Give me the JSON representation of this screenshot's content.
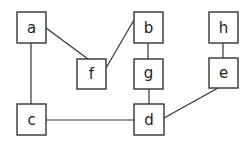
{
  "diagram": {
    "type": "undirected-graph",
    "nodes": [
      {
        "id": "a",
        "label": "a",
        "x": 17,
        "y": 12,
        "w": 29,
        "h": 31
      },
      {
        "id": "f",
        "label": "f",
        "x": 77,
        "y": 59,
        "w": 29,
        "h": 30
      },
      {
        "id": "b",
        "label": "b",
        "x": 134,
        "y": 12,
        "w": 29,
        "h": 31
      },
      {
        "id": "g",
        "label": "g",
        "x": 134,
        "y": 59,
        "w": 29,
        "h": 30
      },
      {
        "id": "h",
        "label": "h",
        "x": 209,
        "y": 12,
        "w": 29,
        "h": 31
      },
      {
        "id": "e",
        "label": "e",
        "x": 209,
        "y": 58,
        "w": 29,
        "h": 30
      },
      {
        "id": "c",
        "label": "c",
        "x": 17,
        "y": 104,
        "w": 29,
        "h": 31
      },
      {
        "id": "d",
        "label": "d",
        "x": 134,
        "y": 104,
        "w": 30,
        "h": 31
      }
    ],
    "edges": [
      {
        "from": "a",
        "to": "f"
      },
      {
        "from": "a",
        "to": "c"
      },
      {
        "from": "b",
        "to": "f"
      },
      {
        "from": "b",
        "to": "g"
      },
      {
        "from": "g",
        "to": "d"
      },
      {
        "from": "h",
        "to": "e"
      },
      {
        "from": "e",
        "to": "d"
      },
      {
        "from": "c",
        "to": "d"
      }
    ],
    "colors": {
      "stroke": "#333333",
      "background": "#ffffff",
      "text": "#222222"
    }
  }
}
